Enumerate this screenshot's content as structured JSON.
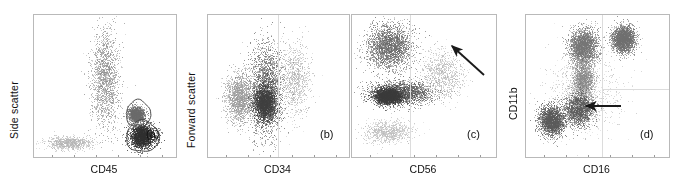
{
  "figure": {
    "type": "flow-cytometry-scatter-panels",
    "panel_count": 4,
    "background": "#ffffff",
    "dot_color": "#555555",
    "frame_color": "#b9b9b9"
  },
  "panels": [
    {
      "tag": "(a)",
      "xlabel": "CD45",
      "ylabel": "Side scatter",
      "has_arrow": false,
      "has_gates": true,
      "gate_count": 2
    },
    {
      "tag": "(b)",
      "xlabel": "CD34",
      "ylabel": "Forward scatter",
      "has_arrow": false,
      "has_gates": false,
      "gate_count": 0
    },
    {
      "tag": "(c)",
      "xlabel": "CD56",
      "ylabel": "",
      "has_arrow": true,
      "arrow_direction": "up-left",
      "has_gates": false,
      "gate_count": 0
    },
    {
      "tag": "(d)",
      "xlabel": "CD16",
      "ylabel": "CD11b",
      "has_arrow": true,
      "arrow_direction": "left",
      "has_gates": false,
      "gate_count": 0
    }
  ],
  "chart_data": {
    "type": "scatter",
    "title": "",
    "xlabel": "",
    "ylabel": "",
    "plots": [
      {
        "tag": "(a)",
        "xlabel": "CD45",
        "ylabel": "Side scatter",
        "xlim": [
          0,
          1
        ],
        "ylim": [
          0,
          1
        ],
        "grid": false,
        "clusters": [
          {
            "name": "CD45-dim blast column",
            "cx": 0.5,
            "cy": 0.45,
            "rx": 0.13,
            "ry": 0.46,
            "density": "medium",
            "shade": "#8e8e8e"
          },
          {
            "name": "CD45-bright lymphocytes",
            "cx": 0.76,
            "cy": 0.85,
            "rx": 0.11,
            "ry": 0.11,
            "density": "high",
            "shade": "#2f2f2f"
          },
          {
            "name": "gated intermediate population",
            "cx": 0.72,
            "cy": 0.7,
            "rx": 0.07,
            "ry": 0.07,
            "density": "medium",
            "shade": "#6a6a6a"
          },
          {
            "name": "low-density debris tail",
            "cx": 0.25,
            "cy": 0.9,
            "rx": 0.2,
            "ry": 0.06,
            "density": "low",
            "shade": "#b5b5b5"
          }
        ],
        "gates": [
          {
            "name": "upper gate",
            "cx": 0.735,
            "cy": 0.695,
            "rx": 0.085,
            "ry": 0.095
          },
          {
            "name": "lower gate",
            "cx": 0.765,
            "cy": 0.855,
            "rx": 0.115,
            "ry": 0.11
          }
        ],
        "annotations": []
      },
      {
        "tag": "(b)",
        "xlabel": "CD34",
        "ylabel": "Forward scatter",
        "xlim": [
          0,
          1
        ],
        "ylim": [
          0,
          1
        ],
        "grid": true,
        "clusters": [
          {
            "name": "main CD34+ population",
            "cx": 0.41,
            "cy": 0.52,
            "rx": 0.16,
            "ry": 0.42,
            "density": "high",
            "shade": "#6a6a6a"
          },
          {
            "name": "dense core",
            "cx": 0.4,
            "cy": 0.62,
            "rx": 0.1,
            "ry": 0.16,
            "density": "high",
            "shade": "#3f3f3f"
          },
          {
            "name": "left shoulder",
            "cx": 0.22,
            "cy": 0.58,
            "rx": 0.12,
            "ry": 0.22,
            "density": "medium",
            "shade": "#9a9a9a"
          },
          {
            "name": "right spread",
            "cx": 0.62,
            "cy": 0.45,
            "rx": 0.14,
            "ry": 0.32,
            "density": "low",
            "shade": "#b0b0b0"
          }
        ],
        "gates": [],
        "annotations": []
      },
      {
        "tag": "(c)",
        "xlabel": "CD56",
        "ylabel": "",
        "xlim": [
          0,
          1
        ],
        "ylim": [
          0,
          1
        ],
        "grid": true,
        "clusters": [
          {
            "name": "upper-left dense cloud",
            "cx": 0.26,
            "cy": 0.22,
            "rx": 0.2,
            "ry": 0.2,
            "density": "high",
            "shade": "#6a6a6a"
          },
          {
            "name": "horizontal mid band",
            "cx": 0.33,
            "cy": 0.55,
            "rx": 0.28,
            "ry": 0.1,
            "density": "high",
            "shade": "#5a5a5a"
          },
          {
            "name": "dense band core",
            "cx": 0.25,
            "cy": 0.57,
            "rx": 0.11,
            "ry": 0.07,
            "density": "high",
            "shade": "#3a3a3a"
          },
          {
            "name": "CD56-positive tail (arrow target)",
            "cx": 0.62,
            "cy": 0.42,
            "rx": 0.2,
            "ry": 0.22,
            "density": "low",
            "shade": "#b3b3b3"
          },
          {
            "name": "lower scatter",
            "cx": 0.25,
            "cy": 0.82,
            "rx": 0.22,
            "ry": 0.1,
            "density": "low",
            "shade": "#bcbcbc"
          }
        ],
        "gates": [],
        "annotations": [
          {
            "type": "arrow",
            "label": "",
            "x1": 0.93,
            "y1": 0.42,
            "x2": 0.72,
            "y2": 0.22,
            "direction": "up-left"
          }
        ]
      },
      {
        "tag": "(d)",
        "xlabel": "CD16",
        "ylabel": "CD11b",
        "xlim": [
          0,
          1
        ],
        "ylim": [
          0,
          1
        ],
        "grid": true,
        "clusters": [
          {
            "name": "upper-middle cluster",
            "cx": 0.4,
            "cy": 0.22,
            "rx": 0.13,
            "ry": 0.16,
            "density": "high",
            "shade": "#757575"
          },
          {
            "name": "upper-right cluster",
            "cx": 0.68,
            "cy": 0.17,
            "rx": 0.1,
            "ry": 0.12,
            "density": "high",
            "shade": "#6f6f6f"
          },
          {
            "name": "mid vertical bridge",
            "cx": 0.4,
            "cy": 0.45,
            "rx": 0.09,
            "ry": 0.16,
            "density": "medium",
            "shade": "#8a8a8a"
          },
          {
            "name": "CD16-dim cluster (arrow target)",
            "cx": 0.37,
            "cy": 0.66,
            "rx": 0.12,
            "ry": 0.14,
            "density": "high",
            "shade": "#5e5e5e"
          },
          {
            "name": "left lower cluster",
            "cx": 0.18,
            "cy": 0.74,
            "rx": 0.11,
            "ry": 0.13,
            "density": "high",
            "shade": "#5a5a5a"
          },
          {
            "name": "diffuse background",
            "cx": 0.4,
            "cy": 0.55,
            "rx": 0.36,
            "ry": 0.4,
            "density": "low",
            "shade": "#c0c0c0"
          }
        ],
        "gates": [],
        "annotations": [
          {
            "type": "arrow",
            "label": "",
            "x1": 0.66,
            "y1": 0.63,
            "x2": 0.42,
            "y2": 0.63,
            "direction": "left"
          }
        ]
      }
    ]
  }
}
